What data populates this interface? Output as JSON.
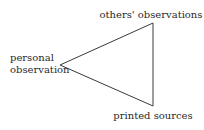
{
  "diagram": {
    "type": "triangle",
    "vertices": {
      "top": {
        "label": "others' observations"
      },
      "left": {
        "label_lines": [
          "personal",
          "observation"
        ]
      },
      "bottom": {
        "label": "printed sources"
      }
    },
    "edges": [
      {
        "from": "left",
        "to": "top"
      },
      {
        "from": "top",
        "to": "bottom"
      },
      {
        "from": "bottom",
        "to": "left"
      }
    ],
    "colors": {
      "line": "#3a3a3a",
      "text": "#2a2a2a",
      "background": "#ffffff"
    }
  }
}
